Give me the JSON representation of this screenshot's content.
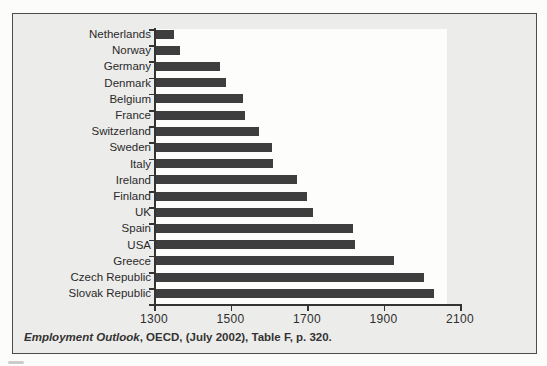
{
  "figure": {
    "caption_italic": "Employment Outlook",
    "caption_rest": ", OECD, (July 2002), Table F, p. 320."
  },
  "chart_data": {
    "type": "bar",
    "orientation": "horizontal",
    "title": "",
    "xlabel": "",
    "ylabel": "",
    "categories": [
      "Netherlands",
      "Norway",
      "Germany",
      "Denmark",
      "Belgium",
      "France",
      "Switzerland",
      "Sweden",
      "Italy",
      "Ireland",
      "Finland",
      "UK",
      "Spain",
      "USA",
      "Greece",
      "Czech Republic",
      "Slovak Republic"
    ],
    "values": [
      1346,
      1364,
      1467,
      1482,
      1528,
      1532,
      1568,
      1603,
      1606,
      1668,
      1694,
      1711,
      1816,
      1821,
      1921,
      2000,
      2026
    ],
    "xlim": [
      1300,
      2100
    ],
    "xticks": [
      1300,
      1500,
      1700,
      1900,
      2100
    ],
    "grid": false,
    "legend": false,
    "source": "Employment Outlook, OECD, (July 2002), Table F, p. 320.",
    "colors": {
      "bar": "#3e3e3e",
      "box_background": "#ececea",
      "plot_background": "#fdfdfc",
      "border": "#4d4d4d",
      "text": "#2a2a2a"
    }
  }
}
